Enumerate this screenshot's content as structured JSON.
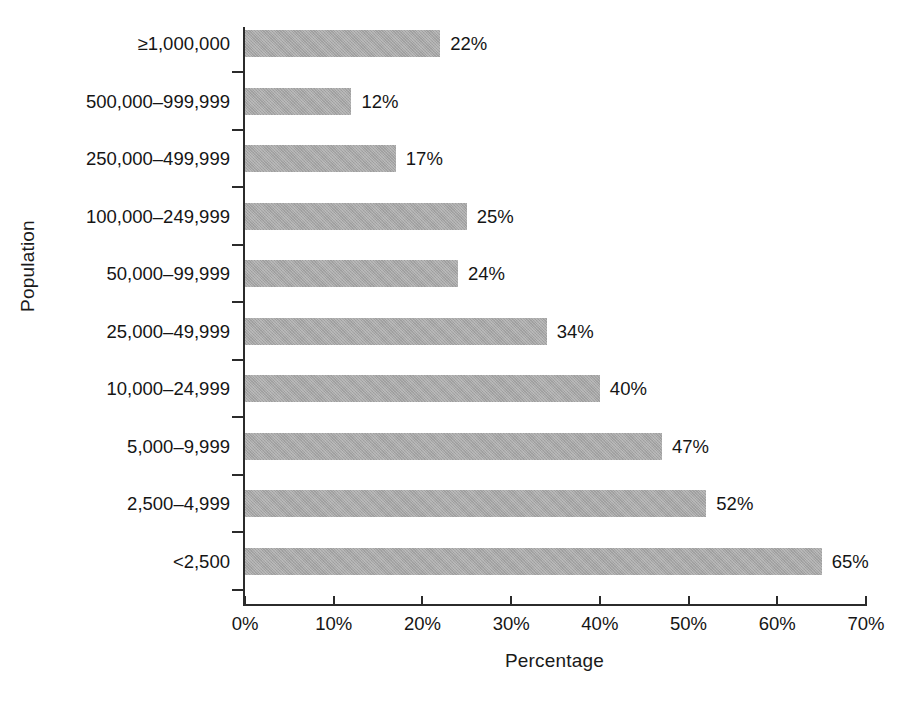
{
  "chart_data": {
    "type": "bar",
    "orientation": "horizontal",
    "title": "",
    "xlabel": "Percentage",
    "ylabel": "Population",
    "xlim": [
      0,
      70
    ],
    "grid": false,
    "legend": null,
    "categories": [
      "≥1,000,000",
      "500,000–999,999",
      "250,000–499,999",
      "100,000–249,999",
      "50,000–99,999",
      "25,000–49,999",
      "10,000–24,999",
      "5,000–9,999",
      "2,500–4,999",
      "<2,500"
    ],
    "values": [
      22,
      12,
      17,
      25,
      24,
      34,
      40,
      47,
      52,
      65
    ],
    "value_labels": [
      "22%",
      "12%",
      "17%",
      "25%",
      "24%",
      "34%",
      "40%",
      "47%",
      "52%",
      "65%"
    ],
    "xticks": [
      0,
      10,
      20,
      30,
      40,
      50,
      60,
      70
    ],
    "xtick_labels": [
      "0%",
      "10%",
      "20%",
      "30%",
      "40%",
      "50%",
      "60%",
      "70%"
    ],
    "bar_color": "#a6a6a6",
    "axis_color": "#2b2b2b",
    "text_color": "#151515",
    "background": "#ffffff"
  }
}
